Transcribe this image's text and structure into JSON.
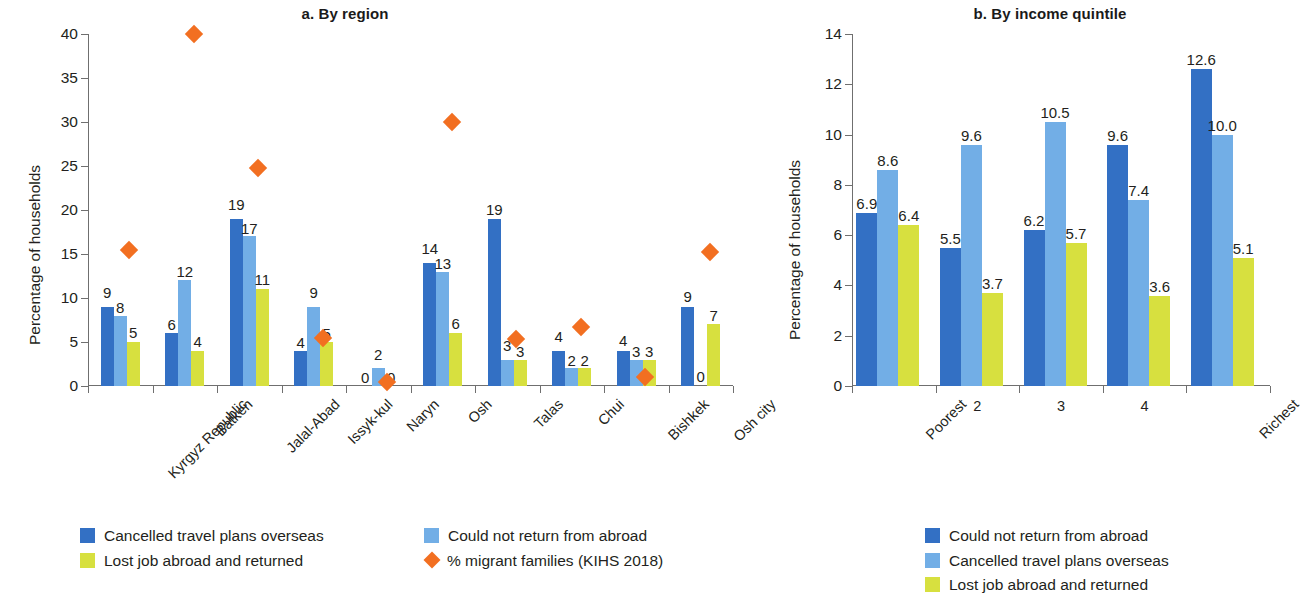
{
  "colors": {
    "series1": "#3370c4",
    "series2": "#72aee6",
    "series3": "#d7e03f",
    "marker": "#f26f21",
    "axis": "#6f6f6f",
    "text": "#231f20"
  },
  "panel_a": {
    "title": "a. By region",
    "ylabel": "Percentage of households",
    "legend": [
      {
        "label": "Cancelled travel plans overseas",
        "marker": "square",
        "color": "#3370c4"
      },
      {
        "label": "Could not return from abroad",
        "marker": "square",
        "color": "#72aee6"
      },
      {
        "label": "Lost job abroad and returned",
        "marker": "square",
        "color": "#d7e03f"
      },
      {
        "label": "% migrant families (KIHS 2018)",
        "marker": "diamond",
        "color": "#f26f21"
      }
    ]
  },
  "panel_b": {
    "title": "b. By income quintile",
    "ylabel": "Percentage of households",
    "legend": [
      {
        "label": "Could not return from abroad",
        "marker": "square",
        "color": "#3370c4"
      },
      {
        "label": "Cancelled travel plans overseas",
        "marker": "square",
        "color": "#72aee6"
      },
      {
        "label": "Lost job abroad and returned",
        "marker": "square",
        "color": "#d7e03f"
      }
    ]
  },
  "chart_data": [
    {
      "type": "bar",
      "title": "a. By region",
      "xlabel": "",
      "ylabel": "Percentage of households",
      "ylim": [
        0,
        40
      ],
      "yticks": [
        0,
        5,
        10,
        15,
        20,
        25,
        30,
        35,
        40
      ],
      "grid": false,
      "legend_position": "below",
      "categories": [
        "Kyrgyz Republic",
        "Batken",
        "Jalal-Abad",
        "Issyk-kul",
        "Naryn",
        "Osh",
        "Talas",
        "Chui",
        "Bishkek",
        "Osh city"
      ],
      "series": [
        {
          "name": "Cancelled travel plans overseas",
          "color": "#3370c4",
          "values": [
            9,
            6,
            19,
            4,
            0,
            14,
            19,
            4,
            4,
            9
          ],
          "labels": [
            "9",
            "6",
            "19",
            "4",
            "0",
            "14",
            "19",
            "4",
            "4",
            "9"
          ]
        },
        {
          "name": "Could not return from abroad",
          "color": "#72aee6",
          "values": [
            8,
            12,
            17,
            9,
            2,
            13,
            3,
            2,
            3,
            0
          ],
          "labels": [
            "8",
            "12",
            "17",
            "9",
            "2",
            "13",
            "3",
            "2",
            "3",
            "0"
          ]
        },
        {
          "name": "Lost job abroad and returned",
          "color": "#d7e03f",
          "values": [
            5,
            4,
            11,
            5,
            0,
            6,
            3,
            2,
            3,
            7
          ],
          "labels": [
            "5",
            "4",
            "11",
            "5",
            "0",
            "6",
            "3",
            "2",
            "3",
            "7"
          ]
        }
      ],
      "marker_series": {
        "name": "% migrant families (KIHS 2018)",
        "color": "#f26f21",
        "shape": "diamond",
        "values": [
          15.4,
          40.0,
          24.8,
          5.4,
          0.5,
          30.0,
          5.3,
          6.7,
          1.0,
          15.2
        ]
      }
    },
    {
      "type": "bar",
      "title": "b. By income quintile",
      "xlabel": "",
      "ylabel": "Percentage of households",
      "ylim": [
        0,
        14
      ],
      "yticks": [
        0,
        2,
        4,
        6,
        8,
        10,
        12,
        14
      ],
      "grid": false,
      "legend_position": "below",
      "categories": [
        "Poorest",
        "2",
        "3",
        "4",
        "Richest"
      ],
      "series": [
        {
          "name": "Could not return from abroad",
          "color": "#3370c4",
          "values": [
            6.9,
            5.5,
            6.2,
            9.6,
            12.6
          ],
          "labels": [
            "6.9",
            "5.5",
            "6.2",
            "9.6",
            "12.6"
          ]
        },
        {
          "name": "Cancelled travel plans overseas",
          "color": "#72aee6",
          "values": [
            8.6,
            9.6,
            10.5,
            7.4,
            10.0
          ],
          "labels": [
            "8.6",
            "9.6",
            "10.5",
            "7.4",
            "10.0"
          ]
        },
        {
          "name": "Lost job abroad and returned",
          "color": "#d7e03f",
          "values": [
            6.4,
            3.7,
            5.7,
            3.6,
            5.1
          ],
          "labels": [
            "6.4",
            "3.7",
            "5.7",
            "3.6",
            "5.1"
          ]
        }
      ]
    }
  ]
}
